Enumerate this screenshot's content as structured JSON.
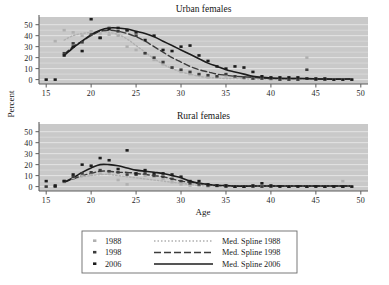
{
  "figure": {
    "background_color": "#ffffff",
    "plot_background_color": "#c9c9c9",
    "grid_color": "#e8e8e8",
    "axis_color": "#5d5d5d"
  },
  "axis_titles": {
    "y": "Percent",
    "x": "Age"
  },
  "legend": {
    "rows": [
      {
        "year": "1988",
        "marker_label": "1988",
        "spline_label": "Med. Spline 1988",
        "color": "#b0b0b0",
        "dash": "1 2"
      },
      {
        "year": "1998",
        "marker_label": "1998",
        "spline_label": "Med. Spline 1998",
        "color": "#3c3c3c",
        "dash": "7 3"
      },
      {
        "year": "2006",
        "marker_label": "2006",
        "spline_label": "Med. Spline 2006",
        "color": "#1c1c1c",
        "dash": "none"
      }
    ]
  },
  "chart_data": [
    {
      "type": "scatter",
      "panel": "upper",
      "title": "Urban females",
      "xlabel": "Age",
      "ylabel": "Percent",
      "xlim": [
        14.2,
        50.8
      ],
      "ylim": [
        -4,
        57
      ],
      "xticks": [
        15,
        20,
        25,
        30,
        35,
        40,
        45,
        50
      ],
      "yticks": [
        0,
        10,
        20,
        30,
        40,
        50
      ],
      "grid": true,
      "legend_position": "below-figure",
      "series": [
        {
          "name": "1988",
          "kind": "points",
          "color": "#b0b0b0",
          "x": [
            15,
            16,
            17,
            18,
            19,
            20,
            21,
            22,
            23,
            24,
            25,
            26,
            27,
            28,
            29,
            30,
            31,
            32,
            33,
            34,
            35,
            36,
            37,
            38,
            39,
            40,
            41,
            42,
            43,
            44,
            45,
            46,
            47,
            48,
            49
          ],
          "y": [
            0,
            35,
            45,
            43,
            40,
            44,
            42,
            41,
            40,
            30,
            27,
            24,
            18,
            14,
            11,
            7,
            5,
            4,
            2,
            2,
            3,
            2,
            1,
            1,
            1,
            0,
            0,
            0,
            0,
            20,
            0,
            0,
            0,
            0,
            0
          ]
        },
        {
          "name": "1998",
          "kind": "points",
          "color": "#3c3c3c",
          "x": [
            17,
            18,
            19,
            20,
            21,
            22,
            23,
            24,
            25,
            26,
            27,
            28,
            29,
            30,
            31,
            32,
            33,
            34,
            35,
            36,
            37,
            38,
            39,
            40,
            41,
            42,
            43,
            44,
            45,
            46
          ],
          "y": [
            24,
            33,
            34,
            41,
            38,
            47,
            44,
            45,
            40,
            24,
            20,
            16,
            11,
            9,
            7,
            5,
            4,
            3,
            5,
            3,
            2,
            1,
            1,
            1,
            0,
            0,
            0,
            9,
            0,
            0
          ]
        },
        {
          "name": "2006",
          "kind": "points",
          "color": "#1c1c1c",
          "x": [
            15,
            16,
            17,
            18,
            19,
            20,
            21,
            22,
            23,
            24,
            25,
            26,
            27,
            28,
            29,
            30,
            31,
            32,
            33,
            34,
            35,
            36,
            37,
            38,
            39,
            40,
            41,
            42,
            43,
            44,
            45,
            46,
            47,
            48,
            49
          ],
          "y": [
            0,
            0,
            22,
            30,
            26,
            55,
            38,
            46,
            47,
            45,
            43,
            36,
            40,
            27,
            26,
            30,
            31,
            22,
            17,
            12,
            10,
            12,
            11,
            7,
            3,
            2,
            2,
            2,
            2,
            1,
            1,
            1,
            0,
            0,
            0
          ]
        },
        {
          "name": "Med. Spline 1988",
          "kind": "spline",
          "color": "#b0b0b0",
          "dash": "1.5 2",
          "x": [
            17,
            18,
            19,
            20,
            21,
            22,
            23,
            24,
            25,
            26,
            27,
            28,
            29,
            30,
            31,
            32,
            33,
            34,
            35,
            36,
            38,
            40,
            43,
            46,
            49
          ],
          "y": [
            36,
            40,
            42,
            43,
            44,
            43,
            41,
            37,
            31,
            25,
            19,
            14,
            10,
            7,
            5,
            3,
            2,
            1.5,
            1,
            1,
            0.5,
            0.5,
            0.5,
            0.5,
            0.5
          ]
        },
        {
          "name": "Med. Spline 1998",
          "kind": "spline",
          "color": "#3c3c3c",
          "dash": "6 3",
          "x": [
            17,
            18,
            19,
            20,
            21,
            22,
            23,
            24,
            25,
            26,
            27,
            28,
            29,
            30,
            31,
            32,
            33,
            34,
            35,
            36,
            38,
            40,
            43,
            46,
            49
          ],
          "y": [
            23,
            30,
            35,
            40,
            44,
            45,
            44,
            42,
            39,
            35,
            30,
            25,
            20,
            16,
            12,
            9,
            7,
            5,
            4,
            3,
            2,
            1,
            1,
            0.5,
            0.5
          ]
        },
        {
          "name": "Med. Spline 2006",
          "kind": "spline",
          "color": "#1c1c1c",
          "dash": "none",
          "x": [
            17,
            18,
            19,
            20,
            21,
            22,
            23,
            24,
            25,
            26,
            27,
            28,
            29,
            30,
            31,
            32,
            33,
            34,
            35,
            36,
            37,
            38,
            39,
            40,
            42,
            44,
            46,
            49
          ],
          "y": [
            22,
            29,
            35,
            41,
            45,
            47,
            47,
            46,
            44,
            42,
            39,
            35,
            31,
            27,
            23,
            19,
            15,
            12,
            9,
            7,
            5,
            3,
            2,
            1.5,
            1,
            1,
            0.5,
            0.5
          ]
        }
      ]
    },
    {
      "type": "scatter",
      "panel": "lower",
      "title": "Rural females",
      "xlabel": "Age",
      "ylabel": "Percent",
      "xlim": [
        14.2,
        50.8
      ],
      "ylim": [
        -4,
        57
      ],
      "xticks": [
        15,
        20,
        25,
        30,
        35,
        40,
        45,
        50
      ],
      "yticks": [
        0,
        10,
        20,
        30,
        40,
        50
      ],
      "grid": true,
      "legend_position": "below-figure",
      "series": [
        {
          "name": "1988",
          "kind": "points",
          "color": "#b0b0b0",
          "x": [
            15,
            16,
            17,
            18,
            19,
            20,
            21,
            22,
            23,
            24,
            25,
            26,
            27,
            28,
            29,
            30,
            31,
            32,
            33,
            34,
            35,
            36,
            37,
            38,
            39,
            40,
            42,
            44,
            46,
            48,
            49
          ],
          "y": [
            0,
            0,
            4,
            8,
            10,
            11,
            12,
            12,
            6,
            2,
            11,
            10,
            9,
            7,
            4,
            2,
            1,
            1,
            0,
            0,
            0,
            0,
            0,
            0,
            0,
            0,
            0,
            0,
            0,
            5,
            0
          ]
        },
        {
          "name": "1998",
          "kind": "points",
          "color": "#3c3c3c",
          "x": [
            15,
            16,
            17,
            18,
            19,
            20,
            21,
            22,
            23,
            24,
            25,
            26,
            27,
            28,
            29,
            30,
            31,
            32,
            33,
            34,
            35,
            36,
            37,
            38,
            39,
            40,
            42,
            44,
            46,
            48
          ],
          "y": [
            0,
            0,
            5,
            9,
            12,
            13,
            15,
            14,
            13,
            11,
            11,
            12,
            10,
            9,
            7,
            5,
            3,
            2,
            1,
            1,
            0,
            0,
            0,
            0,
            0,
            0,
            0,
            0,
            0,
            0
          ]
        },
        {
          "name": "2006",
          "kind": "points",
          "color": "#1c1c1c",
          "x": [
            15,
            16,
            17,
            18,
            19,
            20,
            21,
            22,
            23,
            24,
            25,
            26,
            27,
            28,
            29,
            30,
            31,
            32,
            33,
            34,
            35,
            36,
            37,
            38,
            39,
            40,
            41,
            42,
            43,
            44,
            45,
            46,
            47,
            48,
            49
          ],
          "y": [
            5,
            1,
            5,
            11,
            20,
            19,
            26,
            24,
            16,
            33,
            12,
            15,
            12,
            12,
            11,
            9,
            5,
            5,
            2,
            1,
            1,
            0,
            0,
            1,
            3,
            1,
            0,
            0,
            0,
            0,
            0,
            0,
            0,
            0,
            0
          ]
        },
        {
          "name": "Med. Spline 1988",
          "kind": "spline",
          "color": "#b0b0b0",
          "dash": "1.5 2",
          "x": [
            17,
            18,
            19,
            20,
            21,
            22,
            23,
            24,
            25,
            26,
            27,
            28,
            29,
            30,
            31,
            32,
            33,
            34,
            36,
            38,
            41,
            44,
            47,
            49
          ],
          "y": [
            4,
            7,
            9,
            10,
            11,
            11,
            10,
            9,
            8,
            7,
            6,
            5,
            4,
            3,
            2,
            1,
            0.5,
            0.5,
            0.5,
            0.5,
            0.5,
            0.5,
            0.5,
            0.5
          ]
        },
        {
          "name": "Med. Spline 1998",
          "kind": "spline",
          "color": "#3c3c3c",
          "dash": "6 3",
          "x": [
            17,
            18,
            19,
            20,
            21,
            22,
            23,
            24,
            25,
            26,
            27,
            28,
            29,
            30,
            31,
            32,
            33,
            34,
            35,
            36,
            38,
            41,
            44,
            47,
            49
          ],
          "y": [
            4,
            7,
            10,
            12,
            14,
            14,
            13,
            13,
            12,
            11,
            10,
            9,
            7,
            5,
            4,
            3,
            2,
            1,
            1,
            0.5,
            0.5,
            0.5,
            0.5,
            0.5,
            0.5
          ]
        },
        {
          "name": "Med. Spline 2006",
          "kind": "spline",
          "color": "#1c1c1c",
          "dash": "none",
          "x": [
            17,
            18,
            19,
            20,
            21,
            22,
            23,
            24,
            25,
            26,
            27,
            28,
            29,
            30,
            31,
            32,
            33,
            34,
            35,
            36,
            38,
            41,
            44,
            47,
            49
          ],
          "y": [
            4,
            8,
            13,
            17,
            20,
            20,
            19,
            17,
            15,
            14,
            13,
            12,
            10,
            8,
            5,
            3,
            2,
            1,
            1,
            0.5,
            0.5,
            0.5,
            0.5,
            0.5,
            0.5
          ]
        }
      ]
    }
  ]
}
